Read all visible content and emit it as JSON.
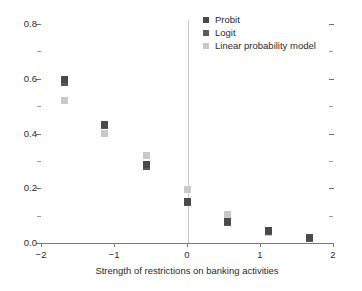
{
  "chart_data": {
    "type": "scatter",
    "title": "",
    "xlabel": "Strength of restrictions on banking activities",
    "ylabel": "",
    "xlim": [
      -2,
      2
    ],
    "ylim": [
      0.0,
      0.8
    ],
    "grid": false,
    "legend_position": "top-right",
    "x_ticks": [
      {
        "value": -2,
        "label": "−2"
      },
      {
        "value": -1,
        "label": "−1"
      },
      {
        "value": 0,
        "label": "0"
      },
      {
        "value": 1,
        "label": "1"
      },
      {
        "value": 2,
        "label": "2"
      }
    ],
    "y_ticks_major": [
      {
        "value": 0.0,
        "label": "0.0"
      },
      {
        "value": 0.2,
        "label": "0.2"
      },
      {
        "value": 0.4,
        "label": "0.4"
      },
      {
        "value": 0.6,
        "label": "0.6"
      },
      {
        "value": 0.8,
        "label": "0.8"
      }
    ],
    "y_ticks_minor": [
      0.1,
      0.3,
      0.5,
      0.7
    ],
    "reference_line_x": 0,
    "series": [
      {
        "name": "Probit",
        "color": "#4a4a4a",
        "points": [
          {
            "x": -1.68,
            "y": 0.598
          },
          {
            "x": -1.13,
            "y": 0.432
          },
          {
            "x": -0.56,
            "y": 0.288
          },
          {
            "x": 0.0,
            "y": 0.152
          },
          {
            "x": 0.56,
            "y": 0.078
          },
          {
            "x": 1.12,
            "y": 0.045
          },
          {
            "x": 1.68,
            "y": 0.02
          }
        ]
      },
      {
        "name": "Logit",
        "color": "#595959",
        "points": [
          {
            "x": -1.68,
            "y": 0.585
          },
          {
            "x": -1.13,
            "y": 0.428
          },
          {
            "x": -0.56,
            "y": 0.28
          },
          {
            "x": 0.0,
            "y": 0.148
          },
          {
            "x": 0.56,
            "y": 0.075
          },
          {
            "x": 1.12,
            "y": 0.043
          },
          {
            "x": 1.68,
            "y": 0.018
          }
        ]
      },
      {
        "name": "Linear probability model",
        "color": "#c9c9c9",
        "points": [
          {
            "x": -1.68,
            "y": 0.52
          },
          {
            "x": -1.13,
            "y": 0.4
          },
          {
            "x": -0.56,
            "y": 0.32
          },
          {
            "x": 0.0,
            "y": 0.196
          },
          {
            "x": 0.56,
            "y": 0.105
          },
          {
            "x": 1.12,
            "y": 0.04
          },
          {
            "x": 1.68,
            "y": 0.018
          }
        ]
      }
    ]
  },
  "legend": {
    "entries": [
      "Probit",
      "Logit",
      "Linear probability model"
    ]
  }
}
